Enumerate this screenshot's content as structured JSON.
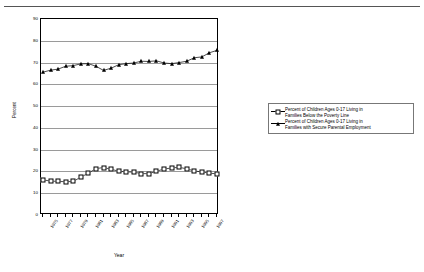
{
  "chart_data": {
    "type": "line",
    "title": "",
    "xlabel": "Year",
    "ylabel": "Percent",
    "ylim": [
      0,
      90
    ],
    "ytick_step": 10,
    "yticks": [
      0,
      10,
      20,
      30,
      40,
      50,
      60,
      70,
      80,
      90
    ],
    "grid": true,
    "legend_position": "right",
    "x": [
      1975,
      1976,
      1977,
      1978,
      1979,
      1980,
      1981,
      1982,
      1983,
      1984,
      1985,
      1986,
      1987,
      1988,
      1989,
      1990,
      1991,
      1992,
      1993,
      1994,
      1995,
      1996,
      1997,
      1998
    ],
    "xtick_labels": [
      "1975",
      "1977",
      "1979",
      "1981",
      "1983",
      "1985",
      "1987",
      "1989",
      "1991",
      "1993",
      "1995",
      "1997"
    ],
    "xtick_values": [
      1975,
      1977,
      1979,
      1981,
      1983,
      1985,
      1987,
      1989,
      1991,
      1993,
      1995,
      1997
    ],
    "series": [
      {
        "name": "Percent of Children Ages 0-17 Living in Families Below the Poverty Line",
        "legend_label": "Percent of Children Ages 0-17 Living in\nFamilies Below the Poverty Line",
        "marker": "open-square",
        "color": "#000000",
        "values": [
          16.1,
          15.6,
          15.4,
          15.3,
          15.4,
          17.4,
          19.2,
          21.3,
          21.8,
          21.0,
          20.1,
          19.8,
          19.7,
          19.0,
          19.0,
          20.1,
          21.1,
          21.6,
          21.9,
          21.2,
          20.2,
          19.8,
          19.2,
          18.9
        ]
      },
      {
        "name": "Percent of Children Ages 0-17 Living in Families with Secure Parental Employment",
        "legend_label": "Percent of Children Ages 0-17 Living in\nFamilies with Secure Parental Employment",
        "marker": "filled-triangle",
        "color": "#000000",
        "values": [
          65.6,
          66.5,
          67.0,
          68.3,
          68.6,
          69.4,
          69.5,
          68.3,
          66.4,
          67.4,
          69.0,
          69.5,
          69.8,
          70.6,
          70.5,
          70.8,
          69.8,
          69.5,
          70.0,
          70.6,
          72.2,
          72.6,
          74.5,
          75.6
        ]
      }
    ]
  }
}
